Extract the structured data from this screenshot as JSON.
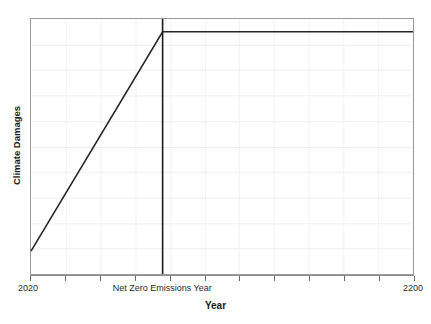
{
  "chart_data": {
    "type": "line",
    "title": "",
    "xlabel": "Year",
    "ylabel": "Climate Damages",
    "xlim": [
      2020,
      2200
    ],
    "ylim": [
      0,
      1
    ],
    "grid": true,
    "legend": null,
    "x_tick_labels": [
      "2020",
      "Net Zero Emissions Year",
      "2200"
    ],
    "x_tick_values": [
      2020,
      2082,
      2200
    ],
    "y_tick_labels": [],
    "series": [
      {
        "name": "Climate Damages",
        "color": "#262626",
        "x": [
          2020,
          2082,
          2200
        ],
        "values": [
          0.09,
          0.95,
          0.95
        ],
        "description": "Damages rise linearly until net zero emissions year, then remain constant"
      }
    ],
    "annotations": [
      {
        "name": "net-zero-emissions-line",
        "type": "vertical-reference-line",
        "x": 2082,
        "label": "Net Zero Emissions Year",
        "color": "#1a1a1a"
      }
    ],
    "gridlines": {
      "horizontal_count": 9,
      "vertical_count": 10,
      "color": "#f0f0f0"
    },
    "axis_color": "#9a9a9a"
  },
  "axes": {
    "x_title": "Year",
    "y_title": "Climate Damages"
  },
  "ticks": {
    "start": "2020",
    "middle": "Net Zero Emissions Year",
    "end": "2200"
  }
}
